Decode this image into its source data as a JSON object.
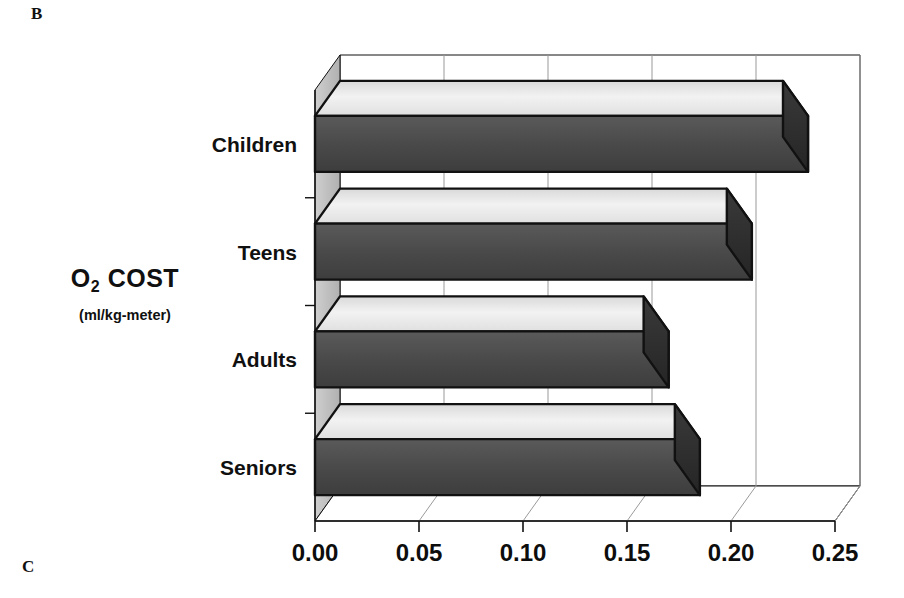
{
  "figure": {
    "panel_label_top": "B",
    "panel_label_bottom": "C"
  },
  "axis_title": {
    "main_prefix": "O",
    "main_sub": "2",
    "main_suffix": " COST",
    "units": "(ml/kg-meter)"
  },
  "colors": {
    "bar_top_face": "#e8e8e8",
    "bar_front_face": "#4a4a4a",
    "bar_side_face": "#2b2b2b",
    "bar_outline": "#111111",
    "wall_left": "#b9b9b9",
    "wall_back": "#ffffff",
    "gridline": "#9a9a9a",
    "axis_line": "#111111",
    "text": "#101010",
    "background": "#ffffff"
  },
  "chart_data": {
    "type": "bar",
    "orientation": "horizontal",
    "style": "3d",
    "title": "",
    "xlabel": "",
    "ylabel": "O2 COST (ml/kg-meter)",
    "categories": [
      "Children",
      "Teens",
      "Adults",
      "Seniors"
    ],
    "values": [
      0.225,
      0.198,
      0.158,
      0.173
    ],
    "xlim": [
      0.0,
      0.25
    ],
    "xticks": [
      0.0,
      0.05,
      0.1,
      0.15,
      0.2,
      0.25
    ],
    "xtick_labels": [
      "0.00",
      "0.05",
      "0.10",
      "0.15",
      "0.20",
      "0.25"
    ],
    "grid": true,
    "grid_axis": "x",
    "legend": false,
    "series": [
      {
        "name": "O2 cost",
        "values": [
          0.225,
          0.198,
          0.158,
          0.173
        ]
      }
    ]
  }
}
